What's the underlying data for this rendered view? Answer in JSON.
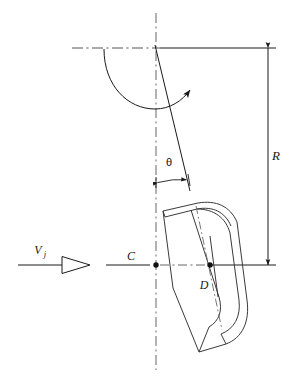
{
  "figure": {
    "type": "engineering-line-diagram",
    "background_color": "#ffffff",
    "line_color": "#1a1a1a"
  },
  "labels": {
    "radius": "R",
    "center": "C",
    "blade_point": "D",
    "jet_velocity_symbol": "V",
    "jet_velocity_subscript": "j",
    "angle": "θ"
  },
  "annotations": {
    "radius_dimension": {
      "label": "R",
      "orientation": "vertical",
      "x": 268,
      "from_y": 48,
      "to_y": 265,
      "label_x": 272,
      "label_y": 159,
      "arrowheads": "both"
    },
    "angle_dimension": {
      "label": "θ",
      "label_x": 168,
      "label_y": 165,
      "arc_from_x": 157,
      "arc_to_x": 188,
      "arc_y": 181,
      "measured_between": "vertical centerline and inclined blade axis"
    },
    "jet_arrow": {
      "label": "V",
      "subscript": "j",
      "label_x": 42,
      "label_y": 254,
      "line_from_x": 18,
      "line_to_x": 140,
      "line_y": 265,
      "arrowhead_style": "hollow-triangle",
      "arrowhead_x": 83,
      "direction": "right"
    },
    "center_point": {
      "label": "C",
      "label_x": 131,
      "label_y": 260,
      "dot_x": 156,
      "dot_y": 265
    },
    "blade_point": {
      "label": "D",
      "label_x": 203,
      "label_y": 288,
      "dot_x": 210,
      "dot_y": 265
    },
    "rotation_arrow": {
      "description": "curved arc with solid arrowhead indicating direction of rotation",
      "sweep": "counterclockwise-to-upper-right",
      "arrowhead_x": 196,
      "arrowhead_y": 78
    }
  },
  "geometry": {
    "vertical_centerline": {
      "x": 156,
      "y1": 13,
      "y2": 370,
      "style": "dash-dot"
    },
    "horizontal_centerline": {
      "y": 265,
      "x1": 18,
      "x2": 276,
      "style": "solid-with-dashdot-segments"
    },
    "top_reference_line": {
      "y": 48,
      "x1": 72,
      "x2": 276,
      "style": "dash-dot-left-solid-right"
    },
    "inclined_axis": {
      "x1": 156,
      "y1": 47,
      "x2": 190,
      "y2": 191,
      "style": "solid"
    },
    "blade": {
      "description": "curved hollow vane cross-section, tilted about 13 degrees from vertical",
      "tilt_degrees": 13
    }
  }
}
